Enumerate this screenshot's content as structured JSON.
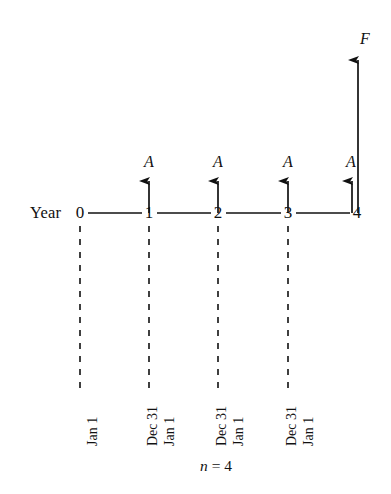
{
  "figure": {
    "type": "cash-flow-diagram",
    "axis_caption": "Year",
    "period_label": {
      "symbol": "n",
      "equals": "=",
      "value": "4"
    },
    "ink_color": "#111111",
    "background_color": "#ffffff"
  },
  "timeline": {
    "ticks": [
      {
        "label": "0",
        "x": 80
      },
      {
        "label": "1",
        "x": 149
      },
      {
        "label": "2",
        "x": 218
      },
      {
        "label": "3",
        "x": 288
      },
      {
        "label": "4",
        "x": 357
      }
    ]
  },
  "cash_flows": {
    "annual": [
      {
        "label": "A",
        "period": "1"
      },
      {
        "label": "A",
        "period": "2"
      },
      {
        "label": "A",
        "period": "3"
      },
      {
        "label": "A",
        "period": "4"
      }
    ],
    "future": {
      "label": "F",
      "period": "4"
    }
  },
  "date_markers": [
    {
      "id": "year0-jan1",
      "label": "Jan 1"
    },
    {
      "id": "year1-dec31",
      "label": "Dec 31"
    },
    {
      "id": "year1-jan1",
      "label": "Jan 1"
    },
    {
      "id": "year2-dec31",
      "label": "Dec 31"
    },
    {
      "id": "year2-jan1",
      "label": "Jan 1"
    },
    {
      "id": "year3-dec31",
      "label": "Dec 31"
    },
    {
      "id": "year3-jan1",
      "label": "Jan 1"
    }
  ]
}
